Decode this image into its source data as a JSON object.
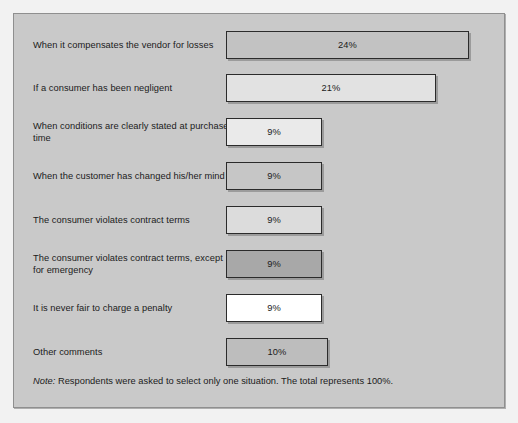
{
  "chart_data": {
    "type": "bar",
    "title": "",
    "subtitle": "",
    "xlabel": "",
    "ylabel": "",
    "orientation": "horizontal",
    "grid": false,
    "legend": "none",
    "xlim": [
      0,
      25
    ],
    "categories": [
      "When it compensates the vendor for losses",
      "If a consumer has been negligent",
      "When conditions are clearly stated at purchase time",
      "When the customer has changed his/her mind",
      "The consumer violates contract terms",
      "The consumer violates contract terms, except for emergency",
      "It is never fair to charge a penalty",
      "Other comments"
    ],
    "values": [
      24,
      21,
      9,
      9,
      9,
      9,
      9,
      10
    ],
    "value_labels": [
      "24%",
      "21%",
      "9%",
      "9%",
      "9%",
      "9%",
      "9%",
      "10%"
    ],
    "bar_fills": [
      "#c2c2c2",
      "#e2e2e2",
      "#eaeaea",
      "#c6c6c6",
      "#dcdcdc",
      "#a8a8a8",
      "#ffffff",
      "#bdbdbd"
    ],
    "annotation_lead": "Note:",
    "annotation": " Respondents were asked to select only one situation. The total represents 100%.",
    "total": "100%"
  },
  "style": {
    "panel_background": "#c9c9c9",
    "panel_border": "#8f8f8f",
    "bar_border": "#2b2b2b",
    "text_color": "#1b1b1b"
  }
}
